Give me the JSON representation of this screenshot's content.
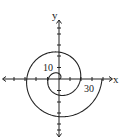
{
  "diagram": {
    "type": "polar-spiral-graph",
    "axes": {
      "x_label": "x",
      "y_label": "y",
      "tick_labels": [
        {
          "axis": "y",
          "value": "10"
        },
        {
          "axis": "x",
          "value": "30"
        }
      ],
      "tick_step": 10
    },
    "curve": {
      "kind": "archimedean-spiral",
      "turns": 2,
      "color": "#222222"
    },
    "colors": {
      "ink": "#222222",
      "background": "#ffffff"
    }
  },
  "chart_data": {
    "type": "line",
    "title": "",
    "xlabel": "x",
    "ylabel": "y",
    "tick_labels": {
      "x": [
        "30"
      ],
      "y": [
        "10"
      ]
    },
    "series": [
      {
        "name": "spiral r = θ (approx, 0 ≤ θ ≤ 4π)",
        "points_polar_deg_r": [
          [
            0,
            0
          ],
          [
            90,
            5
          ],
          [
            180,
            9
          ],
          [
            270,
            13
          ],
          [
            360,
            19
          ],
          [
            450,
            24
          ],
          [
            540,
            29
          ],
          [
            630,
            34
          ],
          [
            720,
            38
          ]
        ]
      }
    ],
    "xlim": [
      -50,
      45
    ],
    "ylim": [
      -50,
      52
    ],
    "grid": false
  }
}
